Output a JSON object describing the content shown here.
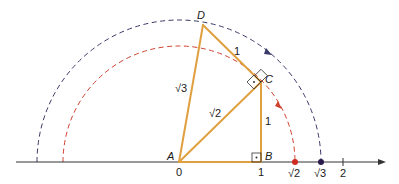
{
  "diagram": {
    "colors": {
      "triangle": "#e0a040",
      "axis": "#333333",
      "arc_sqrt2": "#d04030",
      "arc_sqrt3": "#3a3a6a",
      "point_sqrt2": "#d02a20",
      "point_sqrt3": "#2a1a4a",
      "text": "#1a1a1a"
    },
    "points": {
      "A": {
        "label": "A"
      },
      "B": {
        "label": "B"
      },
      "C": {
        "label": "C"
      },
      "D": {
        "label": "D"
      }
    },
    "segment_labels": {
      "BC": "1",
      "CD": "1",
      "AC": "√2",
      "AD": "√3"
    },
    "axis_ticks": [
      {
        "label": "0",
        "value": 0
      },
      {
        "label": "1",
        "value": 1
      },
      {
        "label": "√2",
        "value": 1.414
      },
      {
        "label": "√3",
        "value": 1.732
      },
      {
        "label": "2",
        "value": 2
      }
    ],
    "right_angle_markers": [
      "B",
      "C"
    ],
    "arcs": [
      {
        "name": "sqrt2-arc",
        "radius_label": "√2",
        "direction": "clockwise to axis"
      },
      {
        "name": "sqrt3-arc",
        "radius_label": "√3",
        "direction": "clockwise to axis"
      }
    ]
  }
}
